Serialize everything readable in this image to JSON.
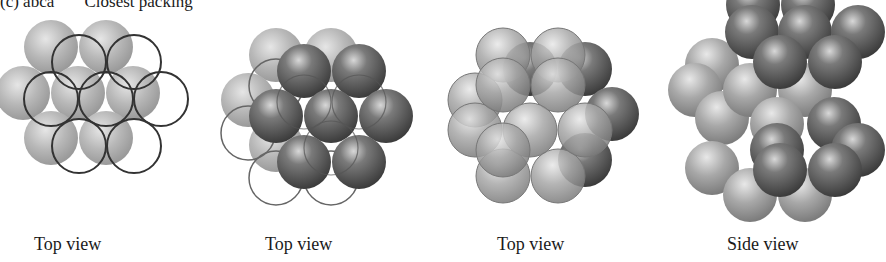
{
  "header": {
    "label": "(c) abca",
    "subtitle": "Closest packing"
  },
  "panels": [
    {
      "caption": "Top view",
      "layers": [
        "A (light spheres)",
        "B (open circles)"
      ]
    },
    {
      "caption": "Top view",
      "layers": [
        "A (light spheres)",
        "B (dark spheres)",
        "C (open circles)"
      ]
    },
    {
      "caption": "Top view",
      "layers": [
        "A",
        "B",
        "C (light spheres overlaid)"
      ]
    },
    {
      "caption": "Side view",
      "layers": [
        "alternating dark and light sphere layers"
      ]
    }
  ],
  "colors": {
    "light_sphere": "#b4b4b4",
    "dark_sphere": "#5a5a5a",
    "outline": "#333333",
    "background": "#ffffff"
  }
}
